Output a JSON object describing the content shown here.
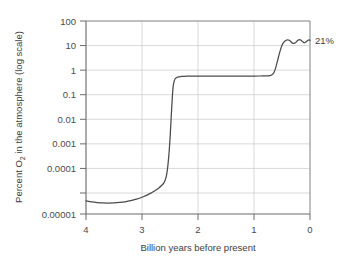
{
  "chart_data": {
    "type": "line",
    "title": "",
    "subtitle": "",
    "xlabel": "Billion years before present",
    "ylabel": "Percent O₂ in the atmosphere (log scale)",
    "ylabel_parts": {
      "prefix": "Percent O",
      "subscript": "2",
      "suffix": " in the atmosphere (log scale)"
    },
    "xlim": [
      4,
      0
    ],
    "x_axis_reversed": true,
    "ylim": [
      1e-05,
      100
    ],
    "y_scale": "log",
    "grid": true,
    "legend": false,
    "legend_position": "none",
    "xticks": [
      4,
      3,
      2,
      1,
      0
    ],
    "xtick_labels": [
      "4",
      "3",
      "2",
      "1",
      "0"
    ],
    "yticks": [
      100,
      10,
      1,
      0.1,
      0.01,
      0.001,
      0.0001,
      1e-05
    ],
    "ytick_labels": [
      "100",
      "10",
      "1",
      "0.1",
      "0.01",
      "0.001",
      "0.0001",
      "0.00001"
    ],
    "series": [
      {
        "name": "Atmospheric oxygen",
        "color": "#4a4a4a",
        "x": [
          4.0,
          3.9,
          3.8,
          3.7,
          3.6,
          3.5,
          3.4,
          3.3,
          3.2,
          3.1,
          3.0,
          2.95,
          2.9,
          2.85,
          2.8,
          2.75,
          2.7,
          2.65,
          2.62,
          2.6,
          2.58,
          2.56,
          2.54,
          2.52,
          2.5,
          2.49,
          2.48,
          2.47,
          2.46,
          2.45,
          2.44,
          2.42,
          2.4,
          2.35,
          2.3,
          2.25,
          2.2,
          2.1,
          2.0,
          1.9,
          1.8,
          1.6,
          1.4,
          1.2,
          1.0,
          0.9,
          0.85,
          0.8,
          0.75,
          0.72,
          0.7,
          0.68,
          0.66,
          0.64,
          0.62,
          0.6,
          0.58,
          0.56,
          0.54,
          0.52,
          0.5,
          0.48,
          0.45,
          0.42,
          0.4,
          0.37,
          0.34,
          0.31,
          0.28,
          0.25,
          0.22,
          0.19,
          0.16,
          0.13,
          0.1,
          0.07,
          0.04,
          0.02,
          0.0
        ],
        "y": [
          3e-05,
          2.75e-05,
          2.6e-05,
          2.52e-05,
          2.5e-05,
          2.53e-05,
          2.62e-05,
          2.78e-05,
          3.05e-05,
          3.45e-05,
          4.05e-05,
          4.45e-05,
          4.95e-05,
          5.6e-05,
          6.4e-05,
          7.45e-05,
          8.8e-05,
          0.000108,
          0.000125,
          0.000145,
          0.000185,
          0.00027,
          0.00052,
          0.0014,
          0.0052,
          0.012,
          0.029,
          0.068,
          0.15,
          0.3,
          0.48,
          0.72,
          0.84,
          0.94,
          0.975,
          0.99,
          0.998,
          1.005,
          1.008,
          1.01,
          1.01,
          1.01,
          1.01,
          1.01,
          1.01,
          1.012,
          1.015,
          1.02,
          1.03,
          1.045,
          1.07,
          1.12,
          1.22,
          1.42,
          1.8,
          2.5,
          3.6,
          5.2,
          7.4,
          10.2,
          13.2,
          15.8,
          18.5,
          20.2,
          20.8,
          20.0,
          17.8,
          15.8,
          15.5,
          17.0,
          19.5,
          21.0,
          20.0,
          17.6,
          16.2,
          17.5,
          19.8,
          20.6,
          20.0
        ]
      }
    ],
    "annotations": [
      {
        "text": "21%",
        "x": 0,
        "y": 20,
        "position": "right-of-axis",
        "name": "oxygen-level-annotation"
      }
    ]
  },
  "axis_titles": {
    "x": "Billion years before present",
    "y_prefix": "Percent O",
    "y_subscript": "2",
    "y_suffix": " in the atmosphere (log scale)"
  },
  "colors": {
    "curve": "#4a4a4a",
    "grid": "#c9c9c9",
    "axis": "#6b6b6b",
    "text": "#3d3d3d",
    "background": "#ffffff"
  }
}
